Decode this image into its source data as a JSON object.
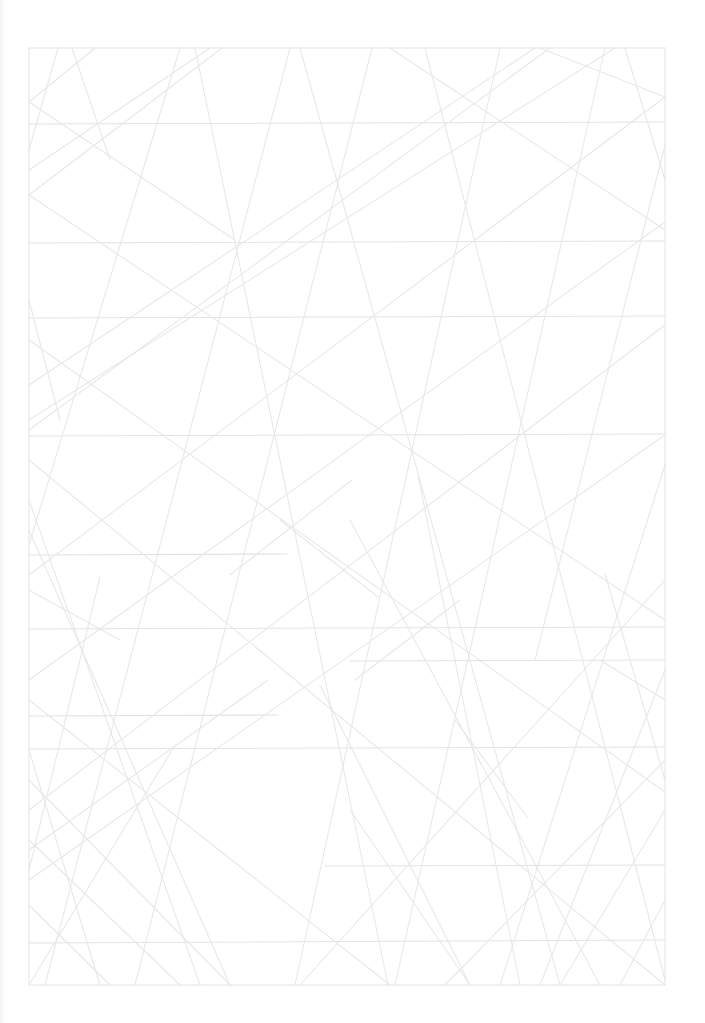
{
  "page": {
    "width": 705,
    "height": 1023,
    "background": "#ffffff"
  },
  "colors": {
    "frame": "#e4e4e4",
    "line": "#e8e8e8",
    "line_dark": "#e2e2e2"
  },
  "frame": {
    "x": 29,
    "y": 48,
    "width": 636,
    "height": 937
  },
  "horizontal_lines": [
    {
      "x1": 29,
      "y1": 124,
      "x2": 665,
      "y2": 122
    },
    {
      "x1": 29,
      "y1": 243,
      "x2": 665,
      "y2": 241
    },
    {
      "x1": 29,
      "y1": 318,
      "x2": 665,
      "y2": 316
    },
    {
      "x1": 29,
      "y1": 436,
      "x2": 665,
      "y2": 434
    },
    {
      "x1": 29,
      "y1": 555,
      "x2": 287,
      "y2": 554
    },
    {
      "x1": 29,
      "y1": 629,
      "x2": 665,
      "y2": 627
    },
    {
      "x1": 350,
      "y1": 661,
      "x2": 665,
      "y2": 660
    },
    {
      "x1": 29,
      "y1": 716,
      "x2": 278,
      "y2": 715
    },
    {
      "x1": 29,
      "y1": 749,
      "x2": 665,
      "y2": 747
    },
    {
      "x1": 325,
      "y1": 866,
      "x2": 665,
      "y2": 865
    },
    {
      "x1": 29,
      "y1": 943,
      "x2": 665,
      "y2": 940
    }
  ],
  "diagonal_lines": [
    {
      "x1": 58,
      "y1": 48,
      "x2": 29,
      "y2": 150
    },
    {
      "x1": 72,
      "y1": 48,
      "x2": 110,
      "y2": 160
    },
    {
      "x1": 95,
      "y1": 48,
      "x2": 29,
      "y2": 102
    },
    {
      "x1": 29,
      "y1": 102,
      "x2": 235,
      "y2": 240
    },
    {
      "x1": 180,
      "y1": 48,
      "x2": 29,
      "y2": 545
    },
    {
      "x1": 195,
      "y1": 48,
      "x2": 388,
      "y2": 985
    },
    {
      "x1": 222,
      "y1": 48,
      "x2": 29,
      "y2": 195
    },
    {
      "x1": 29,
      "y1": 195,
      "x2": 665,
      "y2": 620
    },
    {
      "x1": 29,
      "y1": 170,
      "x2": 210,
      "y2": 48
    },
    {
      "x1": 29,
      "y1": 430,
      "x2": 550,
      "y2": 48
    },
    {
      "x1": 290,
      "y1": 48,
      "x2": 45,
      "y2": 985
    },
    {
      "x1": 300,
      "y1": 48,
      "x2": 560,
      "y2": 985
    },
    {
      "x1": 372,
      "y1": 48,
      "x2": 135,
      "y2": 985
    },
    {
      "x1": 390,
      "y1": 48,
      "x2": 665,
      "y2": 230
    },
    {
      "x1": 425,
      "y1": 48,
      "x2": 665,
      "y2": 980
    },
    {
      "x1": 500,
      "y1": 48,
      "x2": 295,
      "y2": 985
    },
    {
      "x1": 540,
      "y1": 48,
      "x2": 665,
      "y2": 97
    },
    {
      "x1": 535,
      "y1": 48,
      "x2": 29,
      "y2": 385
    },
    {
      "x1": 605,
      "y1": 48,
      "x2": 395,
      "y2": 985
    },
    {
      "x1": 615,
      "y1": 48,
      "x2": 29,
      "y2": 420
    },
    {
      "x1": 625,
      "y1": 48,
      "x2": 665,
      "y2": 180
    },
    {
      "x1": 665,
      "y1": 97,
      "x2": 29,
      "y2": 575
    },
    {
      "x1": 665,
      "y1": 145,
      "x2": 535,
      "y2": 660
    },
    {
      "x1": 665,
      "y1": 222,
      "x2": 29,
      "y2": 680
    },
    {
      "x1": 29,
      "y1": 340,
      "x2": 665,
      "y2": 792
    },
    {
      "x1": 29,
      "y1": 300,
      "x2": 60,
      "y2": 420
    },
    {
      "x1": 665,
      "y1": 325,
      "x2": 29,
      "y2": 810
    },
    {
      "x1": 665,
      "y1": 435,
      "x2": 29,
      "y2": 880
    },
    {
      "x1": 665,
      "y1": 465,
      "x2": 500,
      "y2": 985
    },
    {
      "x1": 29,
      "y1": 460,
      "x2": 665,
      "y2": 985
    },
    {
      "x1": 29,
      "y1": 500,
      "x2": 200,
      "y2": 985
    },
    {
      "x1": 29,
      "y1": 530,
      "x2": 230,
      "y2": 985
    },
    {
      "x1": 230,
      "y1": 575,
      "x2": 352,
      "y2": 480
    },
    {
      "x1": 280,
      "y1": 520,
      "x2": 378,
      "y2": 597
    },
    {
      "x1": 418,
      "y1": 475,
      "x2": 520,
      "y2": 985
    },
    {
      "x1": 350,
      "y1": 520,
      "x2": 600,
      "y2": 985
    },
    {
      "x1": 605,
      "y1": 574,
      "x2": 665,
      "y2": 780
    },
    {
      "x1": 100,
      "y1": 577,
      "x2": 29,
      "y2": 870
    },
    {
      "x1": 665,
      "y1": 580,
      "x2": 300,
      "y2": 985
    },
    {
      "x1": 665,
      "y1": 670,
      "x2": 540,
      "y2": 985
    },
    {
      "x1": 320,
      "y1": 685,
      "x2": 470,
      "y2": 985
    },
    {
      "x1": 355,
      "y1": 680,
      "x2": 460,
      "y2": 600
    },
    {
      "x1": 455,
      "y1": 720,
      "x2": 528,
      "y2": 818
    },
    {
      "x1": 268,
      "y1": 680,
      "x2": 29,
      "y2": 850
    },
    {
      "x1": 29,
      "y1": 700,
      "x2": 390,
      "y2": 985
    },
    {
      "x1": 29,
      "y1": 780,
      "x2": 230,
      "y2": 985
    },
    {
      "x1": 29,
      "y1": 840,
      "x2": 180,
      "y2": 985
    },
    {
      "x1": 29,
      "y1": 750,
      "x2": 100,
      "y2": 985
    },
    {
      "x1": 665,
      "y1": 810,
      "x2": 560,
      "y2": 985
    },
    {
      "x1": 665,
      "y1": 900,
      "x2": 620,
      "y2": 985
    },
    {
      "x1": 665,
      "y1": 760,
      "x2": 445,
      "y2": 985
    },
    {
      "x1": 29,
      "y1": 905,
      "x2": 110,
      "y2": 985
    },
    {
      "x1": 175,
      "y1": 745,
      "x2": 29,
      "y2": 985
    },
    {
      "x1": 600,
      "y1": 660,
      "x2": 665,
      "y2": 700
    },
    {
      "x1": 29,
      "y1": 590,
      "x2": 120,
      "y2": 640
    },
    {
      "x1": 350,
      "y1": 810,
      "x2": 470,
      "y2": 985
    }
  ]
}
